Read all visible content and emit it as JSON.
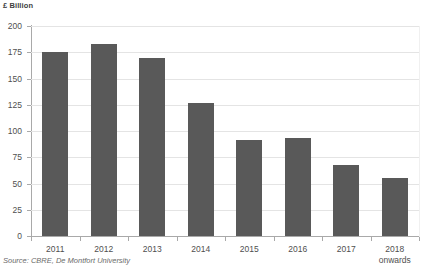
{
  "chart_data": {
    "type": "bar",
    "title": "",
    "subtitle": "",
    "xlabel": "",
    "ylabel": "£ Billion",
    "ylim": [
      0,
      200
    ],
    "yticks": [
      0,
      25,
      50,
      75,
      100,
      125,
      150,
      175,
      200
    ],
    "ytick_labels": [
      "0",
      "25",
      "50",
      "75",
      "100",
      "125",
      "150",
      "175",
      "200"
    ],
    "grid": true,
    "legend": null,
    "legend_position": "none",
    "bar_color": "#595959",
    "categories": [
      "2011",
      "2012",
      "2013",
      "2014",
      "2015",
      "2016",
      "2017",
      "2018 onwards"
    ],
    "category_labels": [
      {
        "main": "2011",
        "sub": ""
      },
      {
        "main": "2012",
        "sub": ""
      },
      {
        "main": "2013",
        "sub": ""
      },
      {
        "main": "2014",
        "sub": ""
      },
      {
        "main": "2015",
        "sub": ""
      },
      {
        "main": "2016",
        "sub": ""
      },
      {
        "main": "2017",
        "sub": ""
      },
      {
        "main": "2018",
        "sub": "onwards"
      }
    ],
    "values": [
      175,
      183,
      170,
      127,
      91,
      93,
      68,
      55
    ],
    "source": "Source: CBRE, De Montfort University"
  },
  "colors": {
    "bar": "#595959",
    "axis": "#a9a9a9",
    "grid": "#e4e4e4",
    "text": "#4f4f4f",
    "background": "#ffffff"
  }
}
